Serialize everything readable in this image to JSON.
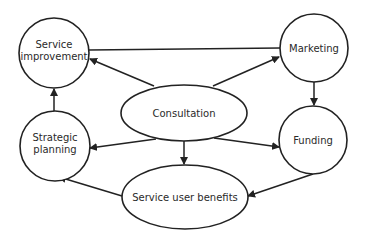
{
  "diagram": {
    "type": "flow",
    "colors": {
      "stroke": "#222222",
      "fill": "#ffffff",
      "text": "#2a2a2a"
    },
    "nodes": [
      {
        "id": "service_improvement",
        "shape": "circle",
        "lines": [
          "Service",
          "improvement"
        ]
      },
      {
        "id": "marketing",
        "shape": "circle",
        "lines": [
          "Marketing"
        ]
      },
      {
        "id": "consultation",
        "shape": "ellipse",
        "lines": [
          "Consultation"
        ]
      },
      {
        "id": "strategic_planning",
        "shape": "circle",
        "lines": [
          "Strategic",
          "planning"
        ]
      },
      {
        "id": "funding",
        "shape": "circle",
        "lines": [
          "Funding"
        ]
      },
      {
        "id": "service_user_benefits",
        "shape": "ellipse",
        "lines": [
          "Service user benefits"
        ]
      }
    ],
    "edges": [
      {
        "from": "service_improvement",
        "to": "marketing",
        "arrow": false
      },
      {
        "from": "consultation",
        "to": "service_improvement",
        "arrow": true
      },
      {
        "from": "consultation",
        "to": "marketing",
        "arrow": true
      },
      {
        "from": "marketing",
        "to": "funding",
        "arrow": true
      },
      {
        "from": "strategic_planning",
        "to": "service_improvement",
        "arrow": true
      },
      {
        "from": "consultation",
        "to": "strategic_planning",
        "arrow": true
      },
      {
        "from": "consultation",
        "to": "funding",
        "arrow": true
      },
      {
        "from": "consultation",
        "to": "service_user_benefits",
        "arrow": true
      },
      {
        "from": "service_user_benefits",
        "to": "strategic_planning",
        "arrow": true
      },
      {
        "from": "funding",
        "to": "service_user_benefits",
        "arrow": true
      }
    ]
  }
}
